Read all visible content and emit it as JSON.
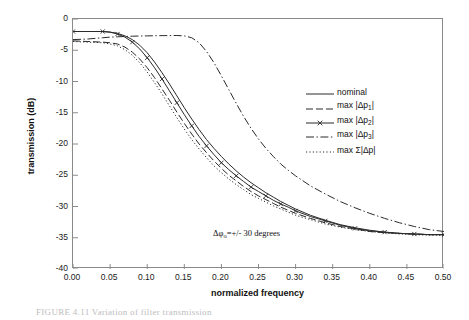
{
  "figure": {
    "caption": "FIGURE 4.11  Variation of filter transmission"
  },
  "annotation": {
    "prefix": "Δφ",
    "subscript": "o",
    "suffix": "=+/- 30 degrees",
    "full_text": "Δφo=+/- 30 degrees"
  },
  "axes": {
    "xlabel": "normalized frequency",
    "ylabel": "transmission (dB)",
    "xticks": [
      "0.00",
      "0.05",
      "0.10",
      "0.15",
      "0.20",
      "0.25",
      "0.30",
      "0.35",
      "0.40",
      "0.45",
      "0.50"
    ],
    "yticks": [
      "0",
      "-5",
      "-10",
      "-15",
      "-20",
      "-25",
      "-30",
      "-35",
      "-40"
    ]
  },
  "legend": {
    "position": "inside-right",
    "items": [
      {
        "name": "nominal",
        "label_prefix": "nominal",
        "label_sub": "",
        "label_suffix": "",
        "style": "solid",
        "marker": "none"
      },
      {
        "name": "max-dp1",
        "label_prefix": "max |Δp",
        "label_sub": "1",
        "label_suffix": "|",
        "style": "dashed",
        "marker": "none"
      },
      {
        "name": "max-dp2",
        "label_prefix": "max |Δp",
        "label_sub": "2",
        "label_suffix": "|",
        "style": "solid-marker",
        "marker": "x"
      },
      {
        "name": "max-dp3",
        "label_prefix": "max |Δp",
        "label_sub": "3",
        "label_suffix": "|",
        "style": "dash-dot",
        "marker": "none"
      },
      {
        "name": "max-sum-dp",
        "label_prefix": "max Σ|Δp",
        "label_sub": "",
        "label_suffix": "|",
        "style": "dotted",
        "marker": "none"
      }
    ]
  },
  "chart_data": {
    "type": "line",
    "title": "",
    "xlabel": "normalized frequency",
    "ylabel": "transmission (dB)",
    "xlim": [
      0.0,
      0.5
    ],
    "ylim": [
      -40,
      0
    ],
    "grid": false,
    "legend_position": "inside-right",
    "x": [
      0.0,
      0.02,
      0.04,
      0.05,
      0.06,
      0.07,
      0.08,
      0.09,
      0.1,
      0.11,
      0.12,
      0.13,
      0.14,
      0.15,
      0.16,
      0.17,
      0.18,
      0.19,
      0.2,
      0.21,
      0.22,
      0.23,
      0.24,
      0.25,
      0.26,
      0.27,
      0.28,
      0.29,
      0.3,
      0.32,
      0.34,
      0.36,
      0.38,
      0.4,
      0.42,
      0.44,
      0.46,
      0.48,
      0.5
    ],
    "series": [
      {
        "name": "nominal",
        "style": "solid",
        "values": [
          -2.0,
          -2.0,
          -2.0,
          -2.1,
          -2.3,
          -2.7,
          -3.3,
          -4.2,
          -5.4,
          -6.9,
          -8.6,
          -10.4,
          -12.3,
          -14.2,
          -16.0,
          -17.7,
          -19.3,
          -20.7,
          -22.0,
          -23.2,
          -24.3,
          -25.3,
          -26.2,
          -27.0,
          -27.8,
          -28.5,
          -29.2,
          -29.8,
          -30.4,
          -31.4,
          -32.2,
          -32.9,
          -33.4,
          -33.8,
          -34.1,
          -34.3,
          -34.4,
          -34.5,
          -34.5
        ]
      },
      {
        "name": "max |Δp1|",
        "style": "dashed",
        "values": [
          -3.5,
          -3.6,
          -3.7,
          -3.8,
          -4.0,
          -4.5,
          -5.3,
          -6.4,
          -7.8,
          -9.4,
          -11.2,
          -13.0,
          -14.9,
          -16.7,
          -18.4,
          -20.0,
          -21.4,
          -22.7,
          -23.9,
          -25.0,
          -25.9,
          -26.8,
          -27.6,
          -28.3,
          -28.9,
          -29.5,
          -30.1,
          -30.6,
          -31.1,
          -31.9,
          -32.6,
          -33.2,
          -33.6,
          -34.0,
          -34.2,
          -34.3,
          -34.4,
          -34.5,
          -34.5
        ]
      },
      {
        "name": "max |Δp2|",
        "style": "solid-marker",
        "marker": "x",
        "values": [
          -2.0,
          -2.0,
          -2.0,
          -2.1,
          -2.4,
          -2.9,
          -3.7,
          -4.8,
          -6.2,
          -7.8,
          -9.6,
          -11.5,
          -13.4,
          -15.3,
          -17.1,
          -18.8,
          -20.3,
          -21.7,
          -23.0,
          -24.1,
          -25.1,
          -26.0,
          -26.9,
          -27.6,
          -28.3,
          -29.0,
          -29.6,
          -30.1,
          -30.7,
          -31.6,
          -32.3,
          -33.0,
          -33.5,
          -33.9,
          -34.1,
          -34.3,
          -34.4,
          -34.5,
          -34.5
        ]
      },
      {
        "name": "max |Δp3|",
        "style": "dash-dot",
        "values": [
          -3.3,
          -3.2,
          -3.0,
          -2.9,
          -2.85,
          -2.8,
          -2.75,
          -2.72,
          -2.7,
          -2.68,
          -2.66,
          -2.65,
          -2.64,
          -2.7,
          -3.0,
          -3.8,
          -5.2,
          -7.0,
          -9.1,
          -11.3,
          -13.5,
          -15.6,
          -17.5,
          -19.2,
          -20.7,
          -22.0,
          -23.2,
          -24.2,
          -25.1,
          -26.7,
          -28.0,
          -29.2,
          -30.2,
          -31.1,
          -31.9,
          -32.6,
          -33.2,
          -33.7,
          -34.0
        ]
      },
      {
        "name": "max Σ|Δp|",
        "style": "dotted",
        "values": [
          -3.6,
          -3.7,
          -3.8,
          -4.0,
          -4.3,
          -4.9,
          -5.8,
          -7.0,
          -8.5,
          -10.2,
          -12.0,
          -13.9,
          -15.8,
          -17.6,
          -19.3,
          -20.8,
          -22.2,
          -23.5,
          -24.6,
          -25.6,
          -26.5,
          -27.3,
          -28.1,
          -28.7,
          -29.3,
          -29.9,
          -30.4,
          -30.9,
          -31.4,
          -32.1,
          -32.8,
          -33.3,
          -33.7,
          -34.0,
          -34.2,
          -34.4,
          -34.5,
          -34.6,
          -34.6
        ]
      }
    ]
  }
}
